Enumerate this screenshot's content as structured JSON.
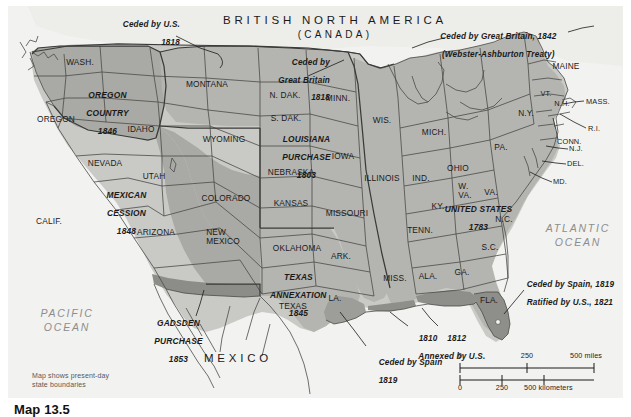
{
  "map": {
    "title_caption": "Map 13.5",
    "credit_note": "Map shows present-day\nstate boundaries",
    "countries": [
      {
        "name": "british-north-america",
        "line1": "BRITISH NORTH AMERICA",
        "line2": "(CANADA)"
      },
      {
        "name": "mexico",
        "line1": "MEXICO"
      }
    ],
    "oceans": [
      {
        "name": "pacific-ocean",
        "line1": "PACIFIC",
        "line2": "OCEAN"
      },
      {
        "name": "atlantic-ocean",
        "line1": "ATLANTIC",
        "line2": "OCEAN"
      }
    ],
    "acquisitions": [
      {
        "name": "oregon-country",
        "lines": [
          "OREGON",
          "COUNTRY",
          "1846"
        ]
      },
      {
        "name": "louisiana-purchase",
        "lines": [
          "LOUISIANA",
          "PURCHASE",
          "1803"
        ]
      },
      {
        "name": "mexican-cession",
        "lines": [
          "MEXICAN",
          "CESSION",
          "1848"
        ]
      },
      {
        "name": "texas-annexation",
        "lines": [
          "TEXAS",
          "ANNEXATION",
          "1845"
        ]
      },
      {
        "name": "gadsden-purchase",
        "lines": [
          "GADSDEN",
          "PURCHASE",
          "1853"
        ]
      },
      {
        "name": "united-states-1783",
        "lines": [
          "UNITED STATES",
          "1783"
        ]
      }
    ],
    "annotations": [
      {
        "name": "ceded-by-us-1818",
        "lines": [
          "Ceded by U.S.",
          "1818"
        ]
      },
      {
        "name": "ceded-by-great-britain-1818",
        "lines": [
          "Ceded by",
          "Great Britain",
          "1818"
        ]
      },
      {
        "name": "webster-ashburton",
        "lines": [
          "Ceded by Great Britain, 1842",
          "(Webster-Ashburton Treaty)"
        ]
      },
      {
        "name": "ceded-by-spain-1819-ratified",
        "lines": [
          "Ceded by Spain, 1819",
          "Ratified by U.S., 1821"
        ]
      },
      {
        "name": "annexed-by-us",
        "lines": [
          "1810    1812",
          "Annexed by U.S."
        ]
      },
      {
        "name": "ceded-by-spain-1819",
        "lines": [
          "Ceded by Spain",
          "1819"
        ]
      }
    ],
    "states": [
      {
        "name": "wash",
        "label": "WASH."
      },
      {
        "name": "oregon",
        "label": "OREGON"
      },
      {
        "name": "idaho",
        "label": "IDAHO"
      },
      {
        "name": "montana",
        "label": "MONTANA"
      },
      {
        "name": "wyoming",
        "label": "WYOMING"
      },
      {
        "name": "nevada",
        "label": "NEVADA"
      },
      {
        "name": "utah",
        "label": "UTAH"
      },
      {
        "name": "colorado",
        "label": "COLORADO"
      },
      {
        "name": "calif",
        "label": "CALIF."
      },
      {
        "name": "arizona",
        "label": "ARIZONA"
      },
      {
        "name": "new-mexico",
        "label": "NEW\nMEXICO"
      },
      {
        "name": "texas",
        "label": "TEXAS"
      },
      {
        "name": "n-dak",
        "label": "N. DAK."
      },
      {
        "name": "s-dak",
        "label": "S. DAK."
      },
      {
        "name": "nebraska",
        "label": "NEBRASKA"
      },
      {
        "name": "kansas",
        "label": "KANSAS"
      },
      {
        "name": "oklahoma",
        "label": "OKLAHOMA"
      },
      {
        "name": "minn",
        "label": "MINN."
      },
      {
        "name": "iowa",
        "label": "IOWA"
      },
      {
        "name": "missouri",
        "label": "MISSOURI"
      },
      {
        "name": "ark",
        "label": "ARK."
      },
      {
        "name": "la",
        "label": "LA."
      },
      {
        "name": "wis",
        "label": "WIS."
      },
      {
        "name": "illinois",
        "label": "ILLINOIS"
      },
      {
        "name": "mich",
        "label": "MICH."
      },
      {
        "name": "ind",
        "label": "IND."
      },
      {
        "name": "ohio",
        "label": "OHIO"
      },
      {
        "name": "ky",
        "label": "KY."
      },
      {
        "name": "tenn",
        "label": "TENN."
      },
      {
        "name": "miss",
        "label": "MISS."
      },
      {
        "name": "ala",
        "label": "ALA."
      },
      {
        "name": "ga",
        "label": "GA."
      },
      {
        "name": "fla",
        "label": "FLA."
      },
      {
        "name": "s-c",
        "label": "S.C."
      },
      {
        "name": "n-c",
        "label": "N.C."
      },
      {
        "name": "va",
        "label": "VA."
      },
      {
        "name": "w-va",
        "label": "W.\nVA."
      },
      {
        "name": "pa",
        "label": "PA."
      },
      {
        "name": "n-y",
        "label": "N.Y."
      },
      {
        "name": "maine",
        "label": "MAINE"
      },
      {
        "name": "vt",
        "label": "VT."
      },
      {
        "name": "n-h",
        "label": "N.H."
      },
      {
        "name": "mass",
        "label": "MASS."
      },
      {
        "name": "r-i",
        "label": "R.I."
      },
      {
        "name": "conn",
        "label": "CONN."
      },
      {
        "name": "n-j",
        "label": "N.J."
      },
      {
        "name": "del",
        "label": "DEL."
      },
      {
        "name": "md",
        "label": "MD."
      }
    ],
    "scale": {
      "miles_ticks": [
        "0",
        "250",
        "500 miles"
      ],
      "km_ticks": [
        "0",
        "250",
        "500 kilometers"
      ]
    },
    "colors": {
      "background": "#f2f2f0",
      "land_light": "#c9c9c6",
      "land_mid": "#b4b4b0",
      "land_dark": "#9d9d99",
      "foreign_land": "#ededea",
      "outline": "#4a4a48",
      "text": "#1a1a1a"
    }
  }
}
